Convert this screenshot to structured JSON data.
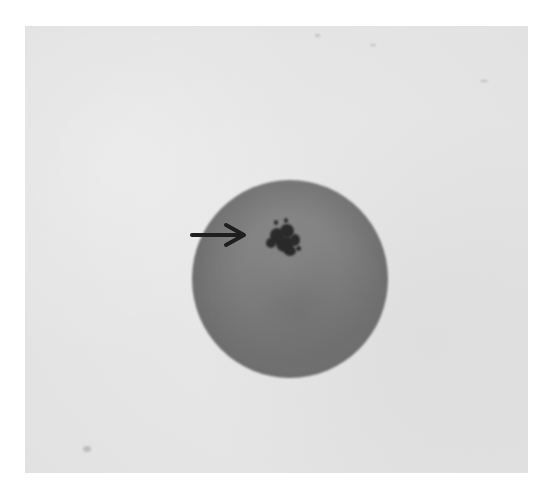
{
  "image": {
    "kind": "grayscale micrograph",
    "subject": "round cell with dark granular cluster",
    "annotation": {
      "type": "arrow",
      "direction": "right",
      "points_to": "dark granular cluster"
    },
    "colors": {
      "page_background": "#ffffff",
      "frame_background": "#e6e6e6",
      "cell_body": "#808080",
      "cluster": "#2a2a2a",
      "arrow": "#1e1e1e"
    }
  }
}
